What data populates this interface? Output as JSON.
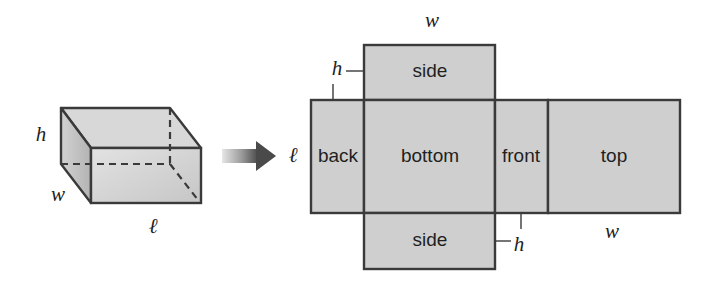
{
  "diagram": {
    "prism": {
      "labels": {
        "height": "h",
        "width": "w",
        "length": "ℓ"
      }
    },
    "arrow": {
      "direction": "right"
    },
    "net": {
      "faces": [
        {
          "id": "back",
          "label": "back"
        },
        {
          "id": "bottom",
          "label": "bottom"
        },
        {
          "id": "front",
          "label": "front"
        },
        {
          "id": "top",
          "label": "top"
        },
        {
          "id": "side-upper",
          "label": "side"
        },
        {
          "id": "side-lower",
          "label": "side"
        }
      ],
      "dimension_labels": {
        "top_width": "w",
        "upper_height": "h",
        "left_length": "ℓ",
        "lower_height": "h",
        "right_width": "w"
      }
    },
    "colors": {
      "face_fill": "#cfcfcf",
      "stroke": "#3a3a3a",
      "text": "#1f1f1f"
    }
  }
}
